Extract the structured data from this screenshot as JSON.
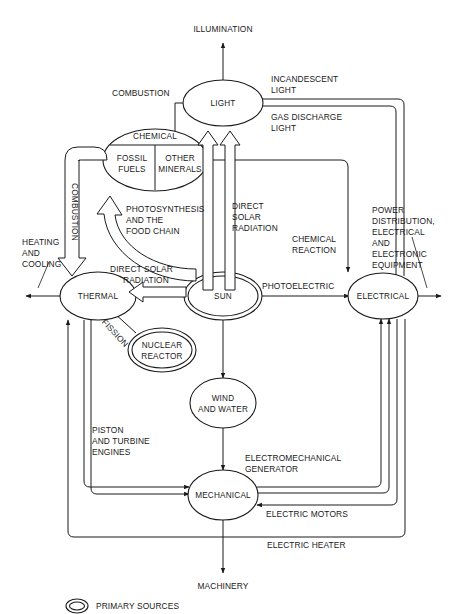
{
  "diagram": {
    "nodes": [
      {
        "id": "light",
        "label": "LIGHT",
        "primary": false
      },
      {
        "id": "chemical",
        "label": "CHEMICAL",
        "primary": false,
        "sub_left": "FOSSIL\nFUELS",
        "sub_left_line1": "FOSSIL",
        "sub_left_line2": "FUELS",
        "sub_right_line1": "OTHER",
        "sub_right_line2": "MINERALS"
      },
      {
        "id": "sun",
        "label": "SUN",
        "primary": true
      },
      {
        "id": "thermal",
        "label": "THERMAL",
        "primary": false
      },
      {
        "id": "electrical",
        "label": "ELECTRICAL",
        "primary": false
      },
      {
        "id": "nuclear",
        "label_line1": "NUCLEAR",
        "label_line2": "REACTOR",
        "primary": true
      },
      {
        "id": "windwater",
        "label_line1": "WIND",
        "label_line2": "AND WATER",
        "primary": false
      },
      {
        "id": "mechanical",
        "label": "MECHANICAL",
        "primary": false
      }
    ],
    "edge_labels": {
      "combustion_to_light": "COMBUSTION",
      "incandescent_light_1": "INCANDESCENT",
      "incandescent_light_2": "LIGHT",
      "gas_discharge_1": "GAS DISCHARGE",
      "gas_discharge_2": "LIGHT",
      "direct_solar_radiation_v1": "DIRECT",
      "direct_solar_radiation_v2": "SOLAR",
      "direct_solar_radiation_v3": "RADIATION",
      "photosynthesis_1": "PHOTOSYNTHESIS",
      "photosynthesis_2": "AND THE",
      "photosynthesis_3": "FOOD CHAIN",
      "combustion_to_thermal": "COMBUSTION",
      "direct_solar_radiation_h1": "DIRECT SOLAR",
      "direct_solar_radiation_h2": "RADIATION",
      "photoelectric": "PHOTOELECTRIC",
      "chemical_reaction_1": "CHEMICAL",
      "chemical_reaction_2": "REACTION",
      "fission": "FISSION",
      "piston_1": "PISTON",
      "piston_2": "AND TURBINE",
      "piston_3": "ENGINES",
      "electromechanical_1": "ELECTROMECHANICAL",
      "electromechanical_2": "GENERATOR",
      "electric_motors": "ELECTRIC MOTORS",
      "electric_heater": "ELECTRIC HEATER",
      "power_dist_1": "POWER",
      "power_dist_2": "DISTRIBUTION,",
      "power_dist_3": "ELECTRICAL",
      "power_dist_4": "AND",
      "power_dist_5": "ELECTRONIC",
      "power_dist_6": "EQUIPMENT",
      "heating_1": "HEATING",
      "heating_2": "AND",
      "heating_3": "COOLING"
    },
    "terminals": {
      "illumination": "ILLUMINATION",
      "machinery": "MACHINERY"
    },
    "legend": {
      "primary_sources": "PRIMARY SOURCES"
    },
    "colors": {
      "ink": "#1a1a1a",
      "paper": "#ffffff"
    }
  }
}
